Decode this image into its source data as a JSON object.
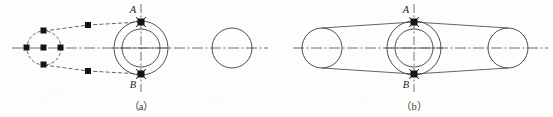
{
  "figure": {
    "caption_a": "（a）",
    "caption_b": "（b）",
    "stroke_color": "#3c3c3c",
    "marker_color": "#141414",
    "centerline_color": "#4a4a4a",
    "background": "#fdfdfb"
  },
  "diagram_a": {
    "name": "(a)",
    "label_top": "A",
    "label_bottom": "B",
    "crank_circle": {
      "style": "dashed",
      "center_x": 44,
      "center_y": 48,
      "radius": 17,
      "markers": [
        {
          "name": "left",
          "x": 27,
          "y": 48
        },
        {
          "name": "center",
          "x": 44,
          "y": 48
        },
        {
          "name": "right",
          "x": 61,
          "y": 48
        },
        {
          "name": "top",
          "x": 44,
          "y": 31
        },
        {
          "name": "bottom",
          "x": 44,
          "y": 65
        }
      ]
    },
    "link_style": "dashed",
    "link_markers": [
      {
        "name": "upper-link-node",
        "x": 88,
        "y": 25
      },
      {
        "name": "lower-link-node",
        "x": 88,
        "y": 71
      }
    ],
    "hub": {
      "center_x": 141,
      "center_y": 48,
      "outer_radius": 27,
      "inner_radius": 19,
      "style": "solid",
      "point_a": {
        "x": 141,
        "y": 22
      },
      "point_b": {
        "x": 141,
        "y": 74
      }
    },
    "right_circle": {
      "center_x": 232,
      "center_y": 48,
      "radius": 20,
      "style": "solid"
    },
    "centerline": {
      "x1": 12,
      "y1": 48,
      "x2": 268,
      "y2": 48,
      "style": "dash-dot"
    },
    "vertical_axis": {
      "x": 141,
      "y1": 4,
      "y2": 92,
      "style": "dash-dot"
    }
  },
  "diagram_b": {
    "name": "(b)",
    "label_top": "A",
    "label_bottom": "B",
    "hub": {
      "center_x": 414,
      "center_y": 48,
      "outer_radius": 27,
      "inner_radius": 19,
      "style": "solid",
      "point_a": {
        "x": 414,
        "y": 22
      },
      "point_b": {
        "x": 414,
        "y": 74
      }
    },
    "left_circle": {
      "center_x": 322,
      "center_y": 48,
      "radius": 20,
      "style": "solid"
    },
    "right_circle": {
      "center_x": 508,
      "center_y": 48,
      "radius": 20,
      "style": "solid"
    },
    "link_style": "solid",
    "centerline": {
      "x1": 293,
      "y1": 48,
      "x2": 548,
      "y2": 48,
      "style": "dash-dot"
    },
    "vertical_axis": {
      "x": 414,
      "y1": 4,
      "y2": 92,
      "style": "dash-dot"
    }
  },
  "ghost_text": {
    "note": "faint show-through text from reverse of page",
    "lines": [
      {
        "text": "· ·  ·   ·",
        "x": 40,
        "y": 92
      },
      {
        "text": "·  ·   · ·    ·",
        "x": 150,
        "y": 90
      },
      {
        "text": "·  ·  ·    ·   ·",
        "x": 300,
        "y": 92
      },
      {
        "text": "·    ·  · ·",
        "x": 450,
        "y": 90
      },
      {
        "text": "·  ·    ·  ·   ·  ·",
        "x": 10,
        "y": 104
      },
      {
        "text": "·   ·  ·     ·",
        "x": 200,
        "y": 104
      },
      {
        "text": "·  ·   ·  ·    ·   ·",
        "x": 330,
        "y": 104
      },
      {
        "text": "·  ·   ·  ·",
        "x": 470,
        "y": 104
      }
    ]
  }
}
